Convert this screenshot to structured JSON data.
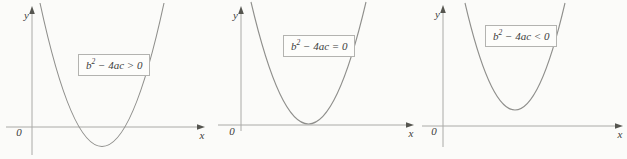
{
  "axes": {
    "x_label": "x",
    "y_label": "y",
    "origin_label": "0"
  },
  "panels": [
    {
      "label_base": "b",
      "label_sup": "2",
      "label_rest": " − 4ac > 0"
    },
    {
      "label_base": "b",
      "label_sup": "2",
      "label_rest": " − 4ac = 0"
    },
    {
      "label_base": "b",
      "label_sup": "2",
      "label_rest": " − 4ac < 0"
    }
  ],
  "colors": {
    "background": "#fbfbf9",
    "axis": "#aaaaa7",
    "arrow": "#55554f",
    "curve": "#8f8f8c",
    "text": "#3c3c3c",
    "box_border": "#b3b3b0",
    "box_background": "#fdfdfb"
  }
}
